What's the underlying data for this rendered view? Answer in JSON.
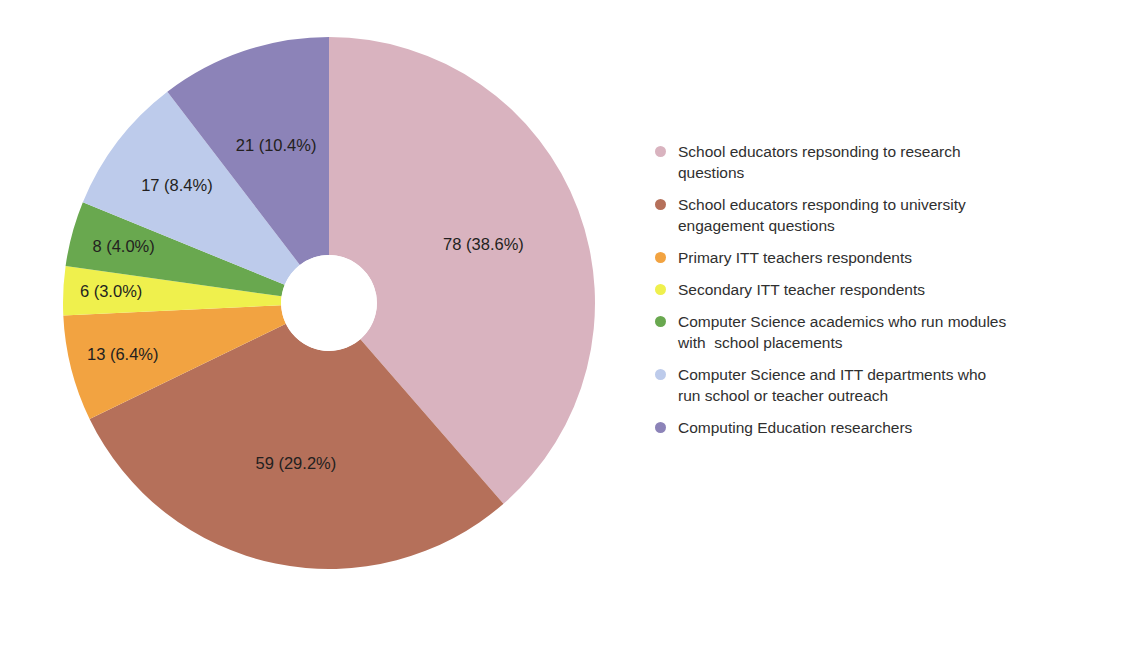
{
  "chart_data": {
    "type": "pie",
    "variant": "donut",
    "title": "",
    "subtitle": "",
    "xlabel": "",
    "ylabel": "",
    "grid": false,
    "legend_position": "right",
    "total": 202,
    "hole_ratio": 0.18,
    "start_angle_deg": 0,
    "direction": "clockwise",
    "categories": [
      "School educators repsonding to research questions",
      "School educators responding to university engagement questions",
      "Primary ITT teachers respondents",
      "Secondary ITT teacher respondents",
      "Computer Science academics who run modules with  school placements",
      "Computer Science and ITT departments who run school or teacher outreach",
      "Computing Education researchers"
    ],
    "values": [
      78,
      59,
      13,
      6,
      8,
      17,
      21
    ],
    "percentages": [
      38.6,
      29.2,
      6.4,
      3.0,
      4.0,
      8.4,
      10.4
    ],
    "data_labels": [
      "78 (38.6%)",
      "59 (29.2%)",
      "13 (6.4%)",
      "6 (3.0%)",
      "8 (4.0%)",
      "17 (8.4%)",
      "21 (10.4%)"
    ],
    "colors": [
      "#d9b3bf",
      "#b5705a",
      "#f2a341",
      "#eff04d",
      "#69a84f",
      "#bdcbeb",
      "#8c83b8"
    ]
  },
  "legend": {
    "items": [
      {
        "label": "School educators repsonding to research\nquestions",
        "color": "#d9b3bf"
      },
      {
        "label": "School educators responding to university\nengagement questions",
        "color": "#b5705a"
      },
      {
        "label": "Primary ITT teachers respondents",
        "color": "#f2a341"
      },
      {
        "label": "Secondary ITT teacher respondents",
        "color": "#eff04d"
      },
      {
        "label": "Computer Science academics who run modules\nwith  school placements",
        "color": "#69a84f"
      },
      {
        "label": "Computer Science and ITT departments who\nrun school or teacher outreach",
        "color": "#bdcbeb"
      },
      {
        "label": "Computing Education researchers",
        "color": "#8c83b8"
      }
    ]
  }
}
